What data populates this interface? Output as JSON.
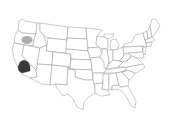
{
  "map": {
    "title": "United States",
    "region": "contiguous-us",
    "style": "state outlines on white",
    "colors": {
      "background": "#ffffff",
      "state_fill": "#ffffff",
      "state_border": "#8a8a8a",
      "highlight_region": "#3a3a3a",
      "highlight_marker": "#a8a8a8"
    },
    "highlights": [
      {
        "name": "southern-california-region",
        "state": "California",
        "shape": "polygon",
        "color": "#3a3a3a"
      },
      {
        "name": "oregon-marker",
        "state": "Oregon",
        "shape": "ellipse",
        "color": "#a8a8a8"
      }
    ]
  }
}
